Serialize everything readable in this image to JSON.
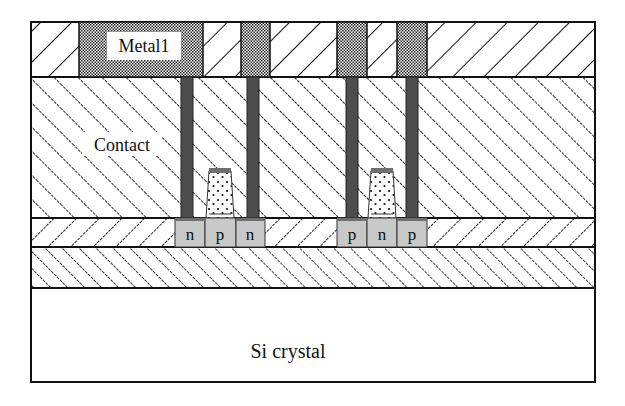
{
  "diagram": {
    "labels": {
      "metal1": "Metal1",
      "contact": "Contact",
      "substrate": "Si crystal"
    },
    "left_transistor": {
      "regions": [
        "n",
        "p",
        "n"
      ]
    },
    "right_transistor": {
      "regions": [
        "p",
        "n",
        "p"
      ]
    },
    "colors": {
      "outline": "#111111",
      "via": "#4d4d4d",
      "diffusion": "#c8c8c8",
      "gate_cap": "#6e6e6e",
      "metal_pattern": "#222222",
      "background": "#ffffff"
    }
  }
}
